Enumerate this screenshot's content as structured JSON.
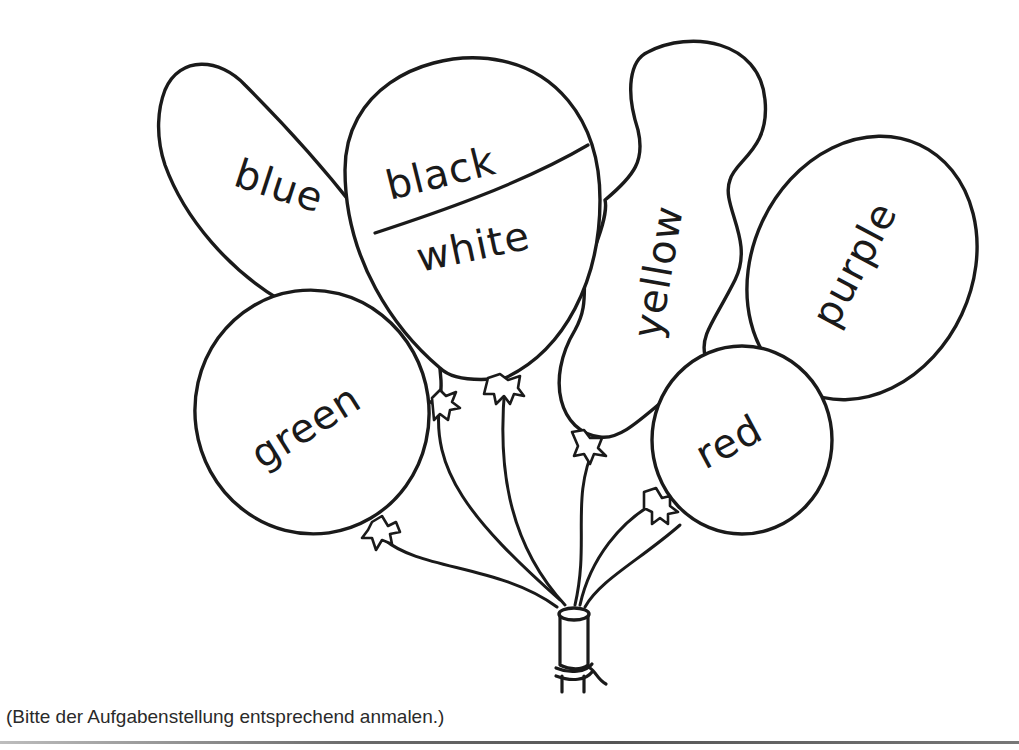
{
  "worksheet": {
    "caption": "(Bitte der Aufgabenstellung entsprechend anmalen.)",
    "balloons": {
      "blue": "blue",
      "black": "black",
      "white": "white",
      "yellow": "yellow",
      "purple": "purple",
      "green": "green",
      "red": "red"
    },
    "colors": {
      "line": "#1a1a1a",
      "paper": "#ffffff"
    }
  }
}
